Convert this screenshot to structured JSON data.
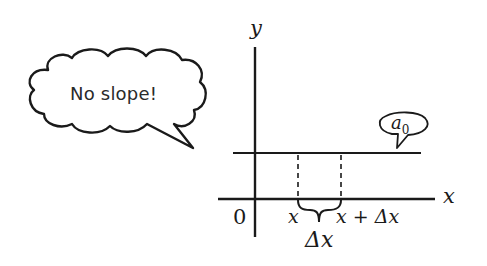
{
  "speech_bubble": {
    "text": "No slope!"
  },
  "axes": {
    "y_label": "y",
    "x_label": "x",
    "origin_label": "0"
  },
  "line_label": {
    "base": "a",
    "subscript": "0"
  },
  "interval": {
    "start_label": "x",
    "end_label": "x + Δx",
    "width_label": "Δx"
  },
  "colors": {
    "stroke": "#1a1a1a",
    "background": "#ffffff"
  }
}
